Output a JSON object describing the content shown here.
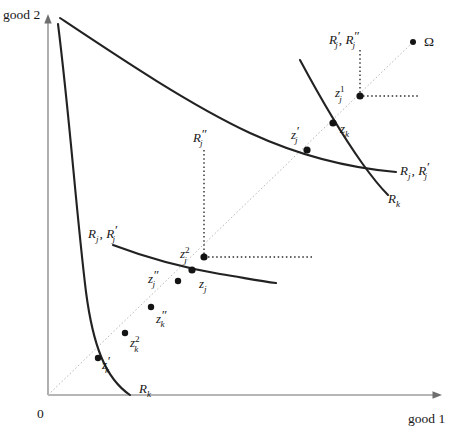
{
  "figure": {
    "background_color": "#ffffff",
    "curve_color": "#222222",
    "ray_color": "#b9b9b9",
    "axis_color": "#6e6e6e",
    "point_color": "#141414"
  },
  "axes": {
    "origin_label": "0",
    "y_axis_label": "good 2",
    "x_axis_label": "good 1",
    "origin": {
      "x": 48,
      "y": 395
    },
    "y_axis_top": {
      "x": 48,
      "y": 18
    },
    "x_axis_right": {
      "x": 440,
      "y": 395
    }
  },
  "points": [
    {
      "key": "omega",
      "label_base": "Ω",
      "label_sup": "",
      "label_sub": "",
      "primes": "",
      "plain": true,
      "x": 413,
      "y": 42,
      "label_x": 424,
      "label_y": 41,
      "r": 3.0
    },
    {
      "key": "z1j",
      "label_base": "z",
      "label_sup": "1",
      "label_sub": "j",
      "primes": "",
      "plain": false,
      "x": 360,
      "y": 96,
      "label_x": 337,
      "label_y": 93,
      "r": 3.6
    },
    {
      "key": "zk",
      "label_base": "z",
      "label_sup": "",
      "label_sub": "k",
      "primes": "",
      "plain": false,
      "x": 333,
      "y": 123,
      "label_x": 340,
      "label_y": 130,
      "r": 3.6
    },
    {
      "key": "zjprime",
      "label_base": "z",
      "label_sup": "",
      "label_sub": "j",
      "primes": "′",
      "plain": false,
      "x": 307,
      "y": 150,
      "label_x": 292,
      "label_y": 136,
      "r": 3.6
    },
    {
      "key": "z2j",
      "label_base": "z",
      "label_sup": "2",
      "label_sub": "j",
      "primes": "",
      "plain": false,
      "x": 204,
      "y": 257,
      "label_x": 181,
      "label_y": 254,
      "r": 3.6
    },
    {
      "key": "zj",
      "label_base": "z",
      "label_sup": "",
      "label_sub": "j",
      "primes": "",
      "plain": false,
      "x": 192,
      "y": 270,
      "label_x": 199,
      "label_y": 285,
      "r": 3.6
    },
    {
      "key": "zjdpr",
      "label_base": "z",
      "label_sup": "",
      "label_sub": "j",
      "primes": "″",
      "plain": false,
      "x": 178,
      "y": 281,
      "label_x": 150,
      "label_y": 283,
      "r": 3.2
    },
    {
      "key": "zkdpr",
      "label_base": "z",
      "label_sup": "",
      "label_sub": "k",
      "primes": "″",
      "plain": false,
      "x": 151,
      "y": 307,
      "label_x": 156,
      "label_y": 321,
      "r": 3.2
    },
    {
      "key": "z2k",
      "label_base": "z",
      "label_sup": "2",
      "label_sub": "k",
      "primes": "",
      "plain": false,
      "x": 125,
      "y": 333,
      "label_x": 130,
      "label_y": 346,
      "r": 3.2
    },
    {
      "key": "zkprime",
      "label_base": "z",
      "label_sup": "",
      "label_sub": "k",
      "primes": "′",
      "plain": false,
      "x": 98,
      "y": 358,
      "label_x": 103,
      "label_y": 371,
      "r": 3.2
    }
  ],
  "curve_labels": [
    {
      "key": "Rj_Rjprime_upper",
      "text": "Rⱼ , R′ⱼ",
      "base": "R",
      "sub": "j",
      "second_base": "R",
      "second_sub": "j",
      "second_primes": "′",
      "x": 400,
      "y": 170
    },
    {
      "key": "Rk_upper",
      "base": "R",
      "sub": "k",
      "primes": "",
      "x": 390,
      "y": 199
    },
    {
      "key": "Rj_Rjprime_lower",
      "base": "R",
      "sub": "j",
      "second_base": "R",
      "second_sub": "j",
      "second_primes": "′",
      "x": 90,
      "y": 234
    },
    {
      "key": "Rk_lower",
      "base": "R",
      "sub": "k",
      "primes": "",
      "x": 140,
      "y": 390
    },
    {
      "key": "Rjprime_Rjdprime",
      "base": "R",
      "sub": "j",
      "primes": "′",
      "second_base": "R",
      "second_sub": "j",
      "second_primes": "″",
      "x": 331,
      "y": 40
    },
    {
      "key": "Rjdprime_middle",
      "base": "R",
      "sub": "j",
      "primes": "″",
      "x": 195,
      "y": 139
    }
  ],
  "guide_lines": [
    {
      "key": "vertical-upper",
      "from": {
        "x": 360,
        "y": 50
      },
      "to": {
        "x": 360,
        "y": 96
      }
    },
    {
      "key": "horizontal-upper",
      "from": {
        "x": 360,
        "y": 96
      },
      "to": {
        "x": 420,
        "y": 96
      }
    },
    {
      "key": "vertical-middle",
      "from": {
        "x": 204,
        "y": 150
      },
      "to": {
        "x": 204,
        "y": 257
      }
    },
    {
      "key": "horizontal-middle",
      "from": {
        "x": 204,
        "y": 257
      },
      "to": {
        "x": 312,
        "y": 257
      }
    }
  ],
  "ray": {
    "from": {
      "x": 48,
      "y": 395
    },
    "to": {
      "x": 410,
      "y": 45
    }
  }
}
